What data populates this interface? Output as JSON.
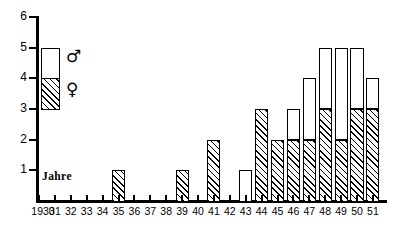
{
  "chart_data": {
    "type": "bar",
    "title": "",
    "subtitle": "",
    "xlabel": "Jahre",
    "ylabel": "",
    "stacked": true,
    "grid": false,
    "legend_position": "inside-top-left",
    "ylim": [
      0,
      6
    ],
    "yticks": [
      1,
      2,
      3,
      4,
      5,
      6
    ],
    "ytick_labels": [
      "1",
      "2",
      "3",
      "4",
      "5",
      "6"
    ],
    "categories": [
      "1930",
      "31",
      "32",
      "33",
      "34",
      "35",
      "36",
      "37",
      "38",
      "39",
      "40",
      "41",
      "42",
      "43",
      "44",
      "45",
      "46",
      "47",
      "48",
      "49",
      "50",
      "51"
    ],
    "series": [
      {
        "name": "♀",
        "legend_label": "female",
        "fill": "hatched",
        "values": [
          0,
          0,
          0,
          0,
          0,
          1,
          0,
          0,
          0,
          1,
          0,
          2,
          0,
          0,
          3,
          2,
          2,
          2,
          3,
          2,
          3,
          3
        ]
      },
      {
        "name": "♂",
        "legend_label": "male",
        "fill": "white",
        "values": [
          0,
          0,
          0,
          0,
          0,
          0,
          0,
          0,
          0,
          0,
          0,
          0,
          0,
          1,
          0,
          0,
          1,
          2,
          2,
          3,
          2,
          1
        ]
      }
    ],
    "totals": [
      0,
      0,
      0,
      0,
      0,
      1,
      0,
      0,
      0,
      1,
      0,
      2,
      0,
      1,
      3,
      2,
      3,
      4,
      5,
      5,
      5,
      4
    ],
    "colors": {
      "axis": "#000000",
      "bar_outline": "#000000",
      "male_fill": "#ffffff",
      "female_fill": "#ffffff",
      "female_hatch": "#000000"
    }
  },
  "legend": {
    "male_symbol": "♂",
    "female_symbol": "♀",
    "male_icon_name": "mars-symbol-icon",
    "female_icon_name": "venus-symbol-icon"
  },
  "annotations": {
    "x_axis_note": "Jahre"
  }
}
